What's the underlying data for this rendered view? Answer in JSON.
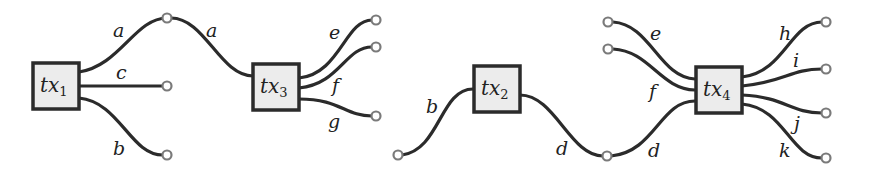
{
  "transactions": [
    {
      "id": "tx1",
      "name": "tx",
      "subscript": "1"
    },
    {
      "id": "tx3",
      "name": "tx",
      "subscript": "3"
    },
    {
      "id": "tx2",
      "name": "tx",
      "subscript": "2"
    },
    {
      "id": "tx4",
      "name": "tx",
      "subscript": "4"
    }
  ],
  "edge_labels": {
    "tx1_a": "a",
    "tx1_c": "c",
    "tx1_b": "b",
    "tx3_a": "a",
    "tx3_e": "e",
    "tx3_f": "f",
    "tx3_g": "g",
    "tx2_b": "b",
    "tx2_d": "d",
    "tx4_d": "d",
    "tx4_e": "e",
    "tx4_f": "f",
    "tx4_h": "h",
    "tx4_i": "i",
    "tx4_j": "j",
    "tx4_k": "k"
  }
}
